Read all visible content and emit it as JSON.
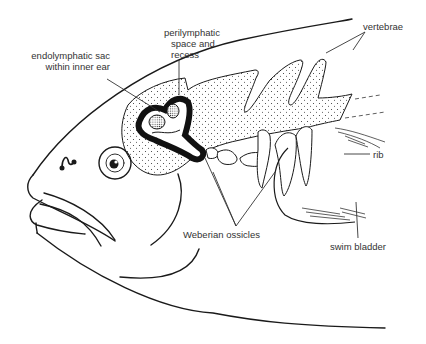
{
  "diagram": {
    "labels": {
      "endolymphatic_sac_line1": "endolymphatic sac",
      "endolymphatic_sac_line2": "within inner ear",
      "perilymphatic_line1": "perilymphatic",
      "perilymphatic_line2": "space and",
      "perilymphatic_line3": "recess",
      "vertebrae": "vertebrae",
      "rib": "rib",
      "weberian_ossicles": "Weberian ossicles",
      "swim_bladder": "swim bladder"
    },
    "colors": {
      "line": "#1a1a1a",
      "text": "#333333",
      "background": "#ffffff"
    }
  }
}
